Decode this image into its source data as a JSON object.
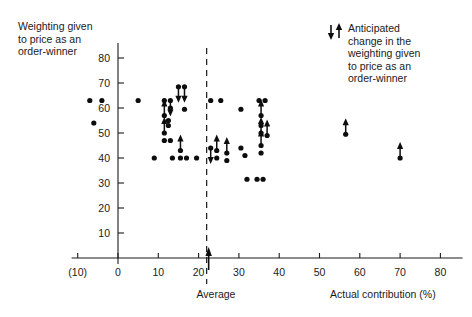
{
  "labels": {
    "y_axis_title": "Weighting given\nto price as an\norder-winner",
    "x_axis_title": "Actual contribution (%)",
    "average_marker": "Average",
    "legend_text": "Anticipated\nchange in the\nweighting given\nto price as an\norder-winner"
  },
  "chart_data": {
    "type": "scatter",
    "title": "",
    "xlabel": "Actual contribution (%)",
    "ylabel": "Weighting given to price as an order-winner",
    "xlim": [
      -13,
      86
    ],
    "ylim": [
      0,
      86
    ],
    "grid": false,
    "legend_position": "top-right",
    "xticks": [
      -10,
      0,
      10,
      20,
      30,
      40,
      50,
      60,
      70,
      80
    ],
    "xtick_labels": [
      "(10)",
      "0",
      "10",
      "20",
      "30",
      "40",
      "50",
      "60",
      "70",
      "80"
    ],
    "yticks": [
      10,
      20,
      30,
      40,
      50,
      60,
      70,
      80
    ],
    "ytick_labels": [
      "10",
      "20",
      "30",
      "40",
      "50",
      "60",
      "70",
      "80"
    ],
    "annotations": [
      {
        "type": "vertical-dashed-line",
        "x": 22,
        "label": "Average"
      },
      {
        "type": "up-arrow-marker",
        "x": 22,
        "y": 0,
        "label": "Average"
      }
    ],
    "legend": [
      {
        "marker": "down-arrow",
        "label": "Anticipated change in the weighting given to price as an order-winner"
      },
      {
        "marker": "up-arrow",
        "label": "Anticipated change in the weighting given to price as an order-winner"
      }
    ],
    "points": [
      {
        "x": -7.0,
        "y": 63,
        "arrow": "none"
      },
      {
        "x": -4.0,
        "y": 63,
        "arrow": "none"
      },
      {
        "x": -6.0,
        "y": 54,
        "arrow": "none"
      },
      {
        "x": 5.0,
        "y": 63,
        "arrow": "none"
      },
      {
        "x": 9.0,
        "y": 40,
        "arrow": "none"
      },
      {
        "x": 11.5,
        "y": 63,
        "arrow": "none"
      },
      {
        "x": 13.0,
        "y": 63,
        "arrow": "down"
      },
      {
        "x": 13.0,
        "y": 60,
        "arrow": "none"
      },
      {
        "x": 11.5,
        "y": 57,
        "arrow": "up"
      },
      {
        "x": 12.5,
        "y": 55,
        "arrow": "none"
      },
      {
        "x": 12.5,
        "y": 53,
        "arrow": "none"
      },
      {
        "x": 11.5,
        "y": 50,
        "arrow": "up"
      },
      {
        "x": 11.5,
        "y": 47,
        "arrow": "none"
      },
      {
        "x": 13.0,
        "y": 47,
        "arrow": "none"
      },
      {
        "x": 13.5,
        "y": 40,
        "arrow": "none"
      },
      {
        "x": 15.0,
        "y": 68.5,
        "arrow": "down"
      },
      {
        "x": 16.5,
        "y": 68.5,
        "arrow": "down"
      },
      {
        "x": 16.5,
        "y": 59.5,
        "arrow": "none"
      },
      {
        "x": 15.5,
        "y": 43,
        "arrow": "up"
      },
      {
        "x": 15.5,
        "y": 40,
        "arrow": "none"
      },
      {
        "x": 17.0,
        "y": 40,
        "arrow": "none"
      },
      {
        "x": 19.5,
        "y": 40,
        "arrow": "none"
      },
      {
        "x": 23.0,
        "y": 63,
        "arrow": "none"
      },
      {
        "x": 25.5,
        "y": 63,
        "arrow": "none"
      },
      {
        "x": 23.0,
        "y": 44,
        "arrow": "down"
      },
      {
        "x": 24.5,
        "y": 43,
        "arrow": "up"
      },
      {
        "x": 24.5,
        "y": 40,
        "arrow": "none"
      },
      {
        "x": 27.0,
        "y": 42,
        "arrow": "up"
      },
      {
        "x": 27.0,
        "y": 39,
        "arrow": "none"
      },
      {
        "x": 30.5,
        "y": 59.5,
        "arrow": "none"
      },
      {
        "x": 30.5,
        "y": 44,
        "arrow": "none"
      },
      {
        "x": 31.5,
        "y": 41,
        "arrow": "none"
      },
      {
        "x": 32.0,
        "y": 31.5,
        "arrow": "none"
      },
      {
        "x": 35.0,
        "y": 63,
        "arrow": "none"
      },
      {
        "x": 36.5,
        "y": 63,
        "arrow": "none"
      },
      {
        "x": 35.5,
        "y": 57,
        "arrow": "up"
      },
      {
        "x": 35.5,
        "y": 53,
        "arrow": "none"
      },
      {
        "x": 35.5,
        "y": 50,
        "arrow": "up"
      },
      {
        "x": 37.0,
        "y": 49,
        "arrow": "up"
      },
      {
        "x": 35.5,
        "y": 45,
        "arrow": "up"
      },
      {
        "x": 35.5,
        "y": 42,
        "arrow": "none"
      },
      {
        "x": 34.5,
        "y": 31.5,
        "arrow": "none"
      },
      {
        "x": 36.0,
        "y": 31.5,
        "arrow": "none"
      },
      {
        "x": 56.5,
        "y": 49.5,
        "arrow": "up"
      },
      {
        "x": 70.0,
        "y": 40,
        "arrow": "up"
      }
    ]
  }
}
